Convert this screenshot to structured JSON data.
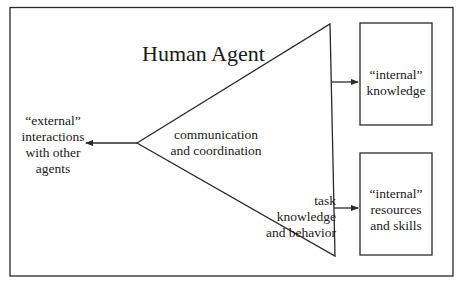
{
  "diagram": {
    "title": "Human Agent",
    "external": "“external”\ninteractions\nwith other\nagents",
    "communication": "communication\nand coordination",
    "task": "task knowledge\nand behavior",
    "internal_knowledge": "“internal”\nknowledge",
    "internal_resources": "“internal”\nresources\nand skills",
    "colors": {
      "stroke": "#2a2a2a",
      "background": "#ffffff"
    }
  }
}
